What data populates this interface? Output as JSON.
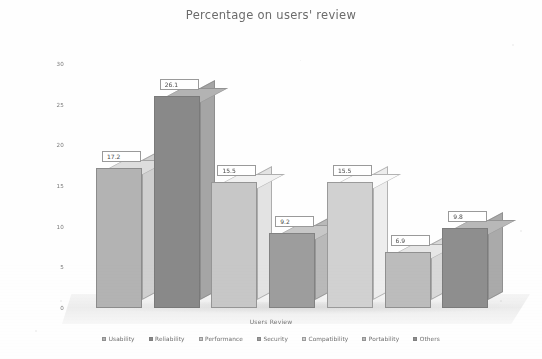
{
  "chart_data": {
    "type": "bar",
    "title": "Percentage on users' review",
    "xlabel": "Users Review",
    "ylabel": "",
    "categories": [
      "Usability",
      "Reliability",
      "Performance",
      "Security",
      "Compatibility",
      "Portability",
      "Others"
    ],
    "values": [
      17.2,
      26.1,
      15.5,
      9.2,
      15.5,
      6.9,
      9.8
    ],
    "value_labels": [
      "17.2",
      "26.1",
      "15.5",
      "9.2",
      "15.5",
      "6.9",
      "9.8"
    ],
    "ylim": [
      0,
      30
    ],
    "yticks": [
      0,
      5,
      10,
      15,
      20,
      25,
      30
    ],
    "ytick_labels": [
      "0",
      "5",
      "10",
      "15",
      "20",
      "25",
      "30"
    ],
    "grid": false,
    "legend_position": "bottom",
    "style": "3d-bar",
    "series_colors": [
      "#b4b4b4",
      "#8a8a8a",
      "#c8c8c8",
      "#9e9e9e",
      "#d2d2d2",
      "#bdbdbd",
      "#8f8f8f"
    ],
    "legend": [
      {
        "label": "Usability",
        "color": "#b4b4b4"
      },
      {
        "label": "Reliability",
        "color": "#8a8a8a"
      },
      {
        "label": "Performance",
        "color": "#c8c8c8"
      },
      {
        "label": "Security",
        "color": "#9e9e9e"
      },
      {
        "label": "Compatibility",
        "color": "#d2d2d2"
      },
      {
        "label": "Portability",
        "color": "#bdbdbd"
      },
      {
        "label": "Others",
        "color": "#8f8f8f"
      }
    ]
  }
}
